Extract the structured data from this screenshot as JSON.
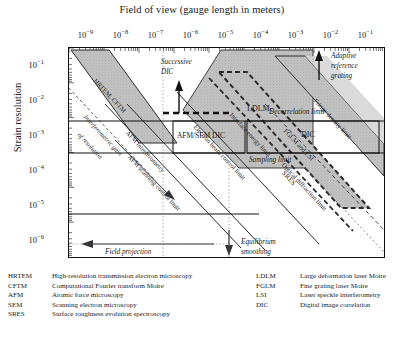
{
  "figure": {
    "title": "Field of view (gauge length in meters)",
    "ylabel": "Strain resolution"
  },
  "chart_data": {
    "type": "scatter",
    "title": "Field of view (gauge length in meters)",
    "xlabel": "Field of view (gauge length in meters)",
    "ylabel": "Strain resolution",
    "xscale": "log",
    "yscale": "log",
    "xlim": [
      3.16e-10,
      0.316
    ],
    "ylim": [
      3.16e-07,
      0.316
    ],
    "xticks": [
      "10-9",
      "10-8",
      "10-7",
      "10-6",
      "10-5",
      "10-4",
      "10-3",
      "10-2",
      "10-1"
    ],
    "xtick_values": [
      1e-09,
      1e-08,
      1e-07,
      1e-06,
      1e-05,
      0.0001,
      0.001,
      0.01,
      0.1
    ],
    "yticks": [
      "10-1",
      "10-2",
      "10-3",
      "10-4",
      "10-5",
      "10-6"
    ],
    "ytick_values": [
      0.1,
      0.01,
      0.001,
      0.0001,
      1e-05,
      1e-06
    ],
    "grid": false,
    "legend_position": "below-plot",
    "regions": [
      {
        "name": "HRTEM, CFTM",
        "style": "shaded-diagonal-band",
        "label": "HRTEM, CFTM"
      },
      {
        "name": "LDLM",
        "style": "shaded-polygon",
        "label": "LDLM"
      },
      {
        "name": "SRES",
        "style": "shaded-diagonal-band",
        "label": "SRES"
      },
      {
        "name": "FGLM and LSI",
        "style": "shaded-diagonal-band",
        "label": "FGLM and LSI"
      },
      {
        "name": "AFM/SEM DIC",
        "style": "outlined-box",
        "label": "AFM/SEM DIC"
      },
      {
        "name": "DIC",
        "style": "outlined-box",
        "label": "DIC"
      }
    ],
    "limit_lines": [
      {
        "label": "Decorrelation limit",
        "style": "solid-horizontal"
      },
      {
        "label": "Sampling limit",
        "style": "solid-horizontal"
      },
      {
        "label": "Fringe density limit",
        "style": "diagonal"
      },
      {
        "label": "Optical diffraction limit",
        "style": "diagonal-dashed"
      },
      {
        "label": "Interface energy limit",
        "style": "diagonal-dashed"
      },
      {
        "label": "Electron beam control limit",
        "style": "diagonal"
      },
      {
        "label": "AFM scanning control limit",
        "style": "diagonal"
      },
      {
        "label": "AFM interferometry",
        "style": "diagonal"
      }
    ],
    "annotations": [
      {
        "label": "Successive DIC",
        "arrow": "up"
      },
      {
        "label": "Adaptive reference grating",
        "arrow": "up"
      },
      {
        "label": "Interferometric gain of resolution",
        "arrow": "down-right"
      },
      {
        "label": "Field projection method",
        "arrow": "left"
      },
      {
        "label": "Equilibrium smoothing",
        "arrow": "down"
      }
    ]
  },
  "plot_labels": {
    "hrtem_cftm": "HRTEM, CFTM",
    "ldlm": "LDLM",
    "sres": "SRES",
    "fglm_lsi": "FGLM and LSI",
    "afm_sem_dic": "AFM/SEM DIC",
    "dic": "DIC",
    "successive_dic_1": "Successive",
    "successive_dic_2": "DIC",
    "adaptive_1": "Adaptive",
    "adaptive_2": "reference",
    "adaptive_3": "grating",
    "decorrelation_limit": "Decorrelation limit",
    "sampling_limit": "Sampling limit",
    "fringe_density_limit": "Fringe density limit",
    "optical_diffraction_limit": "Optical diffraction limit",
    "interface_energy_limit": "Interface energy limit",
    "electron_beam_control_limit": "Electron beam control limit",
    "afm_scanning_control_limit": "AFM scanning control limit",
    "afm_interferometry": "AFM interferometry",
    "interferometric_gain_1": "Interferometric gain",
    "interferometric_gain_2": "of resolution",
    "field_projection_1": "Field projection",
    "field_projection_2": "method",
    "equilibrium_1": "Equilibrium",
    "equilibrium_2": "smoothing"
  },
  "axis": {
    "xticks": [
      {
        "mantissa": "10",
        "exp": "−9"
      },
      {
        "mantissa": "10",
        "exp": "−8"
      },
      {
        "mantissa": "10",
        "exp": "−7"
      },
      {
        "mantissa": "10",
        "exp": "−6"
      },
      {
        "mantissa": "10",
        "exp": "−5"
      },
      {
        "mantissa": "10",
        "exp": "−4"
      },
      {
        "mantissa": "10",
        "exp": "−3"
      },
      {
        "mantissa": "10",
        "exp": "−2"
      },
      {
        "mantissa": "10",
        "exp": "−1"
      }
    ],
    "yticks": [
      {
        "mantissa": "10",
        "exp": "−1"
      },
      {
        "mantissa": "10",
        "exp": "−2"
      },
      {
        "mantissa": "10",
        "exp": "−3"
      },
      {
        "mantissa": "10",
        "exp": "−4"
      },
      {
        "mantissa": "10",
        "exp": "−5"
      },
      {
        "mantissa": "10",
        "exp": "−6"
      }
    ]
  },
  "legend": {
    "left": [
      {
        "abbr": "HRTEM",
        "desc": "High-resolution transmission electron microscopy"
      },
      {
        "abbr": "CFTM",
        "desc": "Computational Fourier transform Moire"
      },
      {
        "abbr": "AFM",
        "desc": "Atomic force microscopy"
      },
      {
        "abbr": "SEM",
        "desc": "Scanning electron microscopy"
      },
      {
        "abbr": "SRES",
        "desc": "Surface roughness evolution spectroscopy"
      }
    ],
    "right": [
      {
        "abbr": "LDLM",
        "desc": "Large deformation laser Moire"
      },
      {
        "abbr": "FGLM",
        "desc": "Fine grating laser Moire"
      },
      {
        "abbr": "LSI",
        "desc": "Laser speckle interferometry"
      },
      {
        "abbr": "DIC",
        "desc": "Digital image correlation"
      }
    ]
  },
  "colors": {
    "ink": "#1a1a1a",
    "band_fill": "#b9b9b9",
    "band_fill_light": "#cfcfcf",
    "frame": "#111111"
  }
}
